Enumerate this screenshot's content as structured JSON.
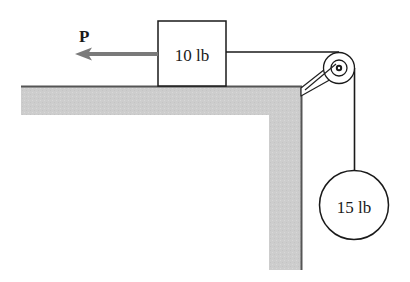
{
  "diagram": {
    "type": "pulley-block-system",
    "force": {
      "label": "P",
      "direction": "left",
      "color": "#7a7a7a"
    },
    "block": {
      "label": "10 lb",
      "position": "on table top"
    },
    "hanging_mass": {
      "label": "15 lb",
      "shape": "sphere"
    },
    "pulley": {
      "location": "table corner, right edge",
      "mount": "bracket arm"
    },
    "table": {
      "fill_color": "#cdcdcd",
      "edge_color": "#555555"
    },
    "rope_color": "#1a1a1a"
  }
}
